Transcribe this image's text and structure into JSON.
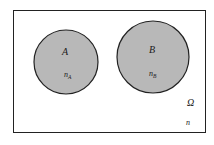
{
  "diagram": {
    "type": "venn",
    "universe": {
      "label": "Ω",
      "count_label": "n"
    },
    "sets": [
      {
        "label": "A",
        "count_label": "n",
        "count_sub": "A",
        "fill": "#b8b8b8"
      },
      {
        "label": "B",
        "count_label": "n",
        "count_sub": "B",
        "fill": "#b8b8b8"
      }
    ],
    "colors": {
      "border": "#222222",
      "circle_fill": "#b8b8b8",
      "background": "#ffffff"
    }
  }
}
